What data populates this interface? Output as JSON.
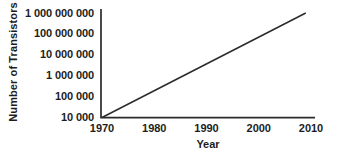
{
  "figure": {
    "background": "#ffffff"
  },
  "chart_data": {
    "type": "line",
    "title": "",
    "xlabel": "Year",
    "ylabel": "Number of Transistors",
    "x_scale": "linear",
    "y_scale": "log10",
    "xlim": [
      1970,
      2010
    ],
    "ylim": [
      10000,
      1000000000
    ],
    "grid": false,
    "legend": null,
    "colors": {
      "axis": "#2b2b2b",
      "series": "#2b2b2b",
      "text": "#1d1d1d",
      "background": "#ffffff"
    },
    "x_ticks": [
      {
        "label": "1970",
        "value": 1970
      },
      {
        "label": "1980",
        "value": 1980
      },
      {
        "label": "1990",
        "value": 1990
      },
      {
        "label": "2000",
        "value": 2000
      },
      {
        "label": "2010",
        "value": 2010
      }
    ],
    "y_ticks": [
      {
        "label": "10 000",
        "value": 10000
      },
      {
        "label": "100 000",
        "value": 100000
      },
      {
        "label": "1 000 000",
        "value": 1000000
      },
      {
        "label": "10 000 000",
        "value": 10000000
      },
      {
        "label": "100 000 000",
        "value": 100000000
      },
      {
        "label": "1 000 000 000",
        "value": 1000000000
      }
    ],
    "series": [
      {
        "name": "Number of Transistors",
        "style": "straight-line",
        "points": [
          {
            "x": 1970,
            "y": 10000
          },
          {
            "x": 2009,
            "y": 1000000000
          }
        ]
      }
    ]
  }
}
